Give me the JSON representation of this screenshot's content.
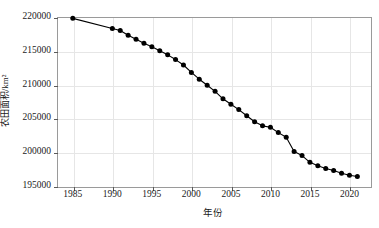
{
  "chart_data": {
    "type": "line",
    "title": "",
    "subtitle": "",
    "xlabel": "年份",
    "ylabel": "农田面积/km²",
    "xlim": [
      1983,
      2022.6
    ],
    "ylim": [
      195000,
      220000
    ],
    "ytick_labels": [
      "195000",
      "200000",
      "205000",
      "210000",
      "215000",
      "220000"
    ],
    "ytick_values": [
      195000,
      200000,
      205000,
      210000,
      215000,
      220000
    ],
    "xtick_labels": [
      "1985",
      "1990",
      "1995",
      "2000",
      "2005",
      "2010",
      "2015",
      "2020"
    ],
    "xtick_values": [
      1985,
      1990,
      1995,
      2000,
      2005,
      2010,
      2015,
      2020
    ],
    "grid": true,
    "grid_color": "#e6e6e6",
    "legend": null,
    "legend_position": "none",
    "marker": "circle-filled",
    "marker_color": "#000000",
    "line_color": "#000000",
    "frame_color": "#9a9a9a",
    "series": [
      {
        "name": "农田面积",
        "x": [
          1985,
          1990,
          1991,
          1992,
          1993,
          1994,
          1995,
          1996,
          1997,
          1998,
          1999,
          2000,
          2001,
          2002,
          2003,
          2004,
          2005,
          2006,
          2007,
          2008,
          2009,
          2010,
          2011,
          2012,
          2013,
          2014,
          2015,
          2016,
          2017,
          2018,
          2019,
          2020,
          2021
        ],
        "values": [
          219800,
          218300,
          218000,
          217300,
          216700,
          216100,
          215600,
          215000,
          214400,
          213700,
          212900,
          211800,
          210800,
          209900,
          209000,
          207900,
          207100,
          206300,
          205400,
          204500,
          203900,
          203700,
          202900,
          202200,
          200100,
          199500,
          198500,
          198000,
          197600,
          197300,
          196900,
          196600,
          196400
        ]
      }
    ]
  }
}
